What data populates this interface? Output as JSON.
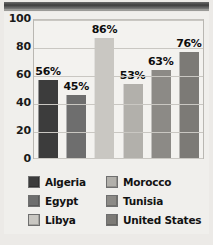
{
  "chart_data": {
    "type": "bar",
    "title": "",
    "xlabel": "",
    "ylabel": "",
    "ylim": [
      0,
      100
    ],
    "yticks": [
      0,
      20,
      40,
      60,
      80,
      100
    ],
    "grid": true,
    "legend_position": "bottom",
    "categories": [
      "Algeria",
      "Morocco",
      "Egypt",
      "Tunisia",
      "Libya",
      "United States"
    ],
    "values": [
      56,
      45,
      86,
      53,
      63,
      76
    ],
    "data_labels": [
      "56%",
      "45%",
      "86%",
      "53%",
      "63%",
      "76%"
    ],
    "colors": [
      "#3c3c3c",
      "#6e6e6e",
      "#c9c7c2",
      "#b2b0ab",
      "#8c8a86",
      "#7c7a76"
    ]
  },
  "legend": {
    "items": [
      {
        "label": "Algeria",
        "color": "#3c3c3c"
      },
      {
        "label": "Morocco",
        "color": "#b2b0ab"
      },
      {
        "label": "Egypt",
        "color": "#6e6e6e"
      },
      {
        "label": "Tunisia",
        "color": "#8c8a86"
      },
      {
        "label": "Libya",
        "color": "#c9c7c2"
      },
      {
        "label": "United States",
        "color": "#7c7a76"
      }
    ]
  }
}
